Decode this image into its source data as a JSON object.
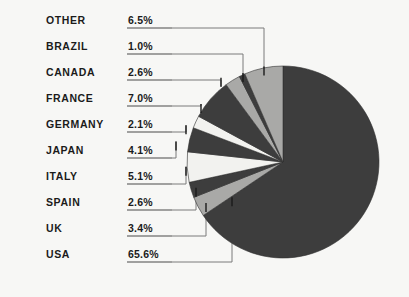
{
  "chart_data": {
    "type": "pie",
    "title": "",
    "subtitle": "",
    "xlabel": "",
    "ylabel": "",
    "unit": "%",
    "legend_position": "left-callout-labels",
    "grid": false,
    "start_angle_deg": 0,
    "direction": "clockwise",
    "categories": [
      "OTHER",
      "BRAZIL",
      "CANADA",
      "FRANCE",
      "GERMANY",
      "JAPAN",
      "ITALY",
      "SPAIN",
      "UK",
      "USA"
    ],
    "values": [
      6.5,
      1.0,
      2.6,
      7.0,
      2.1,
      4.1,
      5.1,
      2.6,
      3.4,
      65.6
    ],
    "value_labels": [
      "6.5%",
      "1.0%",
      "2.6%",
      "7.0%",
      "2.1%",
      "4.1%",
      "5.1%",
      "2.6%",
      "3.4%",
      "65.6%"
    ],
    "slice_colors": [
      "#a9a9a7",
      "#3d3d3d",
      "#a9a9a7",
      "#3d3d3d",
      "#f2f2ef",
      "#3d3d3d",
      "#f2f2ef",
      "#3d3d3d",
      "#a9a9a7",
      "#3d3d3d"
    ],
    "total": 100.0
  },
  "colors": {
    "background": "#f7f7f5",
    "dark_slice": "#3d3d3d",
    "light_slice": "#a9a9a7",
    "white_slice": "#f2f2ef",
    "text": "#1b1b1b",
    "leader_line": "#7b7b7b",
    "underline": "#4a4a4a"
  },
  "rows": [
    {
      "name": "OTHER",
      "value": "6.5%"
    },
    {
      "name": "BRAZIL",
      "value": "1.0%"
    },
    {
      "name": "CANADA",
      "value": "2.6%"
    },
    {
      "name": "FRANCE",
      "value": "7.0%"
    },
    {
      "name": "GERMANY",
      "value": "2.1%"
    },
    {
      "name": "JAPAN",
      "value": "4.1%"
    },
    {
      "name": "ITALY",
      "value": "5.1%"
    },
    {
      "name": "SPAIN",
      "value": "2.6%"
    },
    {
      "name": "UK",
      "value": "3.4%"
    },
    {
      "name": "USA",
      "value": "65.6%"
    }
  ]
}
